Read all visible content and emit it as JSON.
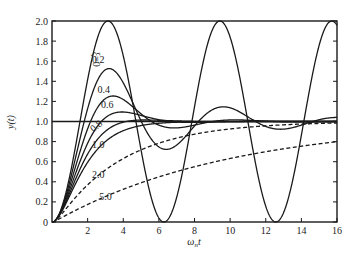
{
  "chart_data": {
    "type": "line",
    "title": "",
    "xlabel": "ωnt",
    "ylabel": "y(t)",
    "xlim": [
      0,
      16
    ],
    "ylim": [
      0,
      2.0
    ],
    "x_ticks": [
      2,
      4,
      6,
      8,
      10,
      12,
      14,
      16
    ],
    "y_ticks": [
      0,
      0.2,
      0.4,
      0.6,
      0.8,
      1.0,
      1.2,
      1.4,
      1.6,
      1.8,
      2.0
    ],
    "y_tick_labels": [
      "0",
      "0.2",
      "0.4",
      "0.6",
      "0.8",
      "1.0",
      "1.2",
      "1.4",
      "1.6",
      "1.8",
      "2.0"
    ],
    "x_tick_labels": [
      "2",
      "4",
      "6",
      "8",
      "10",
      "12",
      "14",
      "16"
    ],
    "grid": false,
    "reference_line": {
      "y": 1.0
    },
    "series": [
      {
        "name": "ξ=0",
        "zeta": 0.0,
        "style": "solid",
        "label": "ξ=0",
        "label_pos": [
          2.3,
          1.62
        ],
        "label_rotate": 90
      },
      {
        "name": "0.2",
        "zeta": 0.2,
        "style": "solid",
        "label": "0.2",
        "label_pos": [
          2.6,
          1.58
        ]
      },
      {
        "name": "0.4",
        "zeta": 0.4,
        "style": "solid",
        "label": "0.4",
        "label_pos": [
          2.9,
          1.28
        ]
      },
      {
        "name": "0.6",
        "zeta": 0.6,
        "style": "solid",
        "label": "0.6",
        "label_pos": [
          3.1,
          1.13
        ]
      },
      {
        "name": "0.8",
        "zeta": 0.8,
        "style": "solid",
        "label": "0.8",
        "label_pos": [
          2.6,
          0.93
        ],
        "label_rotate": -40
      },
      {
        "name": "1.0",
        "zeta": 1.0,
        "style": "solid",
        "label": "1.0",
        "label_pos": [
          2.6,
          0.74
        ]
      },
      {
        "name": "2.0",
        "zeta": 2.0,
        "style": "dashed",
        "label": "2.0",
        "label_pos": [
          2.6,
          0.44
        ]
      },
      {
        "name": "5.0",
        "zeta": 5.0,
        "style": "dashed",
        "label": "5.0",
        "label_pos": [
          3.0,
          0.22
        ]
      }
    ],
    "sample_points": {
      "x": [
        0,
        2,
        4,
        6,
        8,
        10,
        12,
        14,
        16
      ],
      "ξ=0": [
        0,
        1.42,
        1.65,
        0.04,
        1.15,
        1.84,
        0.16,
        0.86,
        1.96
      ],
      "0.2": [
        0,
        1.31,
        1.34,
        0.81,
        0.93,
        1.13,
        1.02,
        0.94,
        1.02
      ],
      "0.4": [
        0,
        1.14,
        1.19,
        0.96,
        0.98,
        1.01,
        1.0,
        1.0,
        1.0
      ],
      "0.6": [
        0,
        0.97,
        1.08,
        1.01,
        1.0,
        1.0,
        1.0,
        1.0,
        1.0
      ],
      "0.8": [
        0,
        0.85,
        1.02,
        1.01,
        1.0,
        1.0,
        1.0,
        1.0,
        1.0
      ],
      "1.0": [
        0,
        0.59,
        0.91,
        0.98,
        1.0,
        1.0,
        1.0,
        1.0,
        1.0
      ],
      "2.0": [
        0,
        0.41,
        0.66,
        0.8,
        0.88,
        0.93,
        0.96,
        0.97,
        0.98
      ],
      "5.0": [
        0,
        0.18,
        0.33,
        0.45,
        0.55,
        0.63,
        0.7,
        0.75,
        0.8
      ]
    },
    "axis_color": "#1a1a1a",
    "line_color": "#1a1a1a"
  }
}
